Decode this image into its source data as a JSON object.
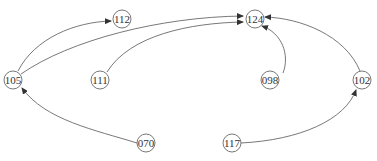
{
  "graph": {
    "nodes": [
      {
        "id": "112",
        "label": "112",
        "x": 122,
        "y": 19
      },
      {
        "id": "124",
        "label": "124",
        "x": 255,
        "y": 19
      },
      {
        "id": "105",
        "label": "105",
        "x": 13,
        "y": 80
      },
      {
        "id": "111",
        "label": "111",
        "x": 100,
        "y": 80
      },
      {
        "id": "098",
        "label": "098",
        "x": 270,
        "y": 80
      },
      {
        "id": "102",
        "label": "102",
        "x": 362,
        "y": 80
      },
      {
        "id": "070",
        "label": "070",
        "x": 146,
        "y": 143
      },
      {
        "id": "117",
        "label": "117",
        "x": 232,
        "y": 143
      }
    ],
    "edges": [
      {
        "from": "105",
        "to": "112"
      },
      {
        "from": "105",
        "to": "124"
      },
      {
        "from": "111",
        "to": "124"
      },
      {
        "from": "098",
        "to": "124"
      },
      {
        "from": "102",
        "to": "124"
      },
      {
        "from": "070",
        "to": "105"
      },
      {
        "from": "117",
        "to": "102"
      }
    ]
  }
}
